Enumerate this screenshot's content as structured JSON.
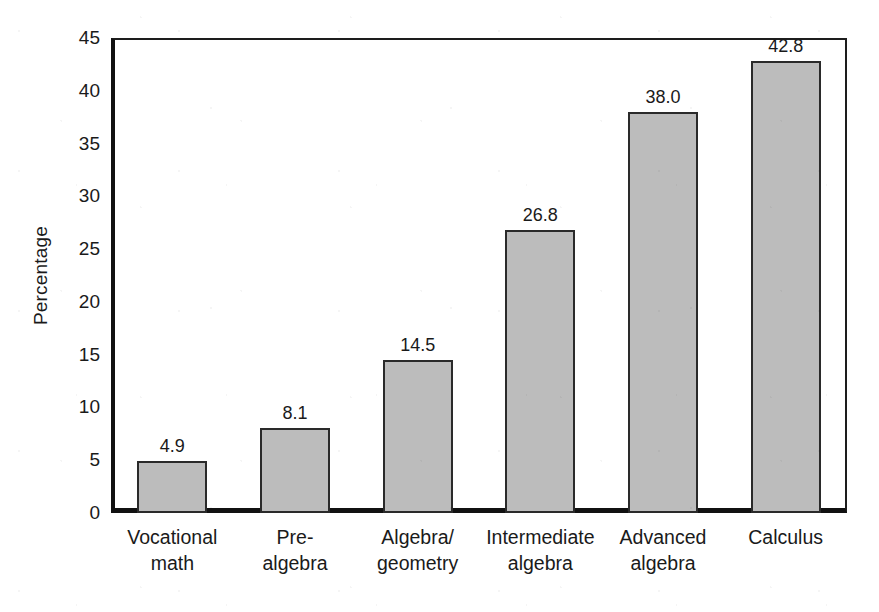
{
  "chart_data": {
    "type": "bar",
    "title": "",
    "subtitle": "",
    "xlabel": "",
    "ylabel": "Percentage",
    "categories": [
      "Vocational math",
      "Pre-algebra",
      "Algebra/geometry",
      "Intermediate algebra",
      "Advanced algebra",
      "Calculus"
    ],
    "category_lines": [
      [
        "Vocational",
        "math"
      ],
      [
        "Pre-",
        "algebra"
      ],
      [
        "Algebra/",
        "geometry"
      ],
      [
        "Intermediate",
        "algebra"
      ],
      [
        "Advanced",
        "algebra"
      ],
      [
        "Calculus",
        ""
      ]
    ],
    "values": [
      4.9,
      8.1,
      14.5,
      26.8,
      38.0,
      42.8
    ],
    "value_labels": [
      "4.9",
      "8.1",
      "14.5",
      "26.8",
      "38.0",
      "42.8"
    ],
    "ylim": [
      0,
      45
    ],
    "yticks": [
      0,
      5,
      10,
      15,
      20,
      25,
      30,
      35,
      40,
      45
    ],
    "ytick_labels": [
      "0",
      "5",
      "10",
      "15",
      "20",
      "25",
      "30",
      "35",
      "40",
      "45"
    ],
    "grid": false,
    "legend": null,
    "legend_position": "none",
    "bar_fill_color": "#bcbcbc",
    "bar_edge_color": "#2a2a2a",
    "axis_color": "#111111",
    "background_color": "#ffffff",
    "text_color": "#1a1a1a"
  }
}
